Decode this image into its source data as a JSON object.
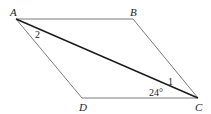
{
  "diagram": {
    "type": "parallelogram-with-diagonal",
    "vertices": {
      "A": {
        "label": "A",
        "x": 16,
        "y": 19
      },
      "B": {
        "label": "B",
        "x": 133,
        "y": 19
      },
      "C": {
        "label": "C",
        "x": 198,
        "y": 98
      },
      "D": {
        "label": "D",
        "x": 82,
        "y": 98
      }
    },
    "sides": [
      "AB",
      "BC",
      "CD",
      "DA"
    ],
    "diagonal": "AC",
    "angles": {
      "angle_2": {
        "label": "2",
        "at": "A"
      },
      "angle_1": {
        "label": "1",
        "at": "C"
      },
      "angle_DCA": {
        "label": "24°",
        "at": "C"
      }
    },
    "colors": {
      "side": "#7a7a7a",
      "diagonal": "#1a1a1a",
      "text": "#222222"
    }
  }
}
